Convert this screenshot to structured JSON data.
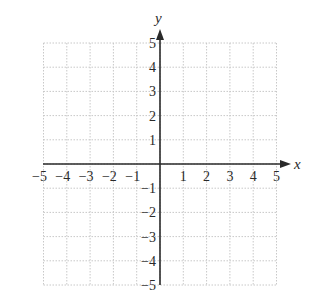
{
  "chart_data": {
    "type": "scatter",
    "title": "",
    "xlabel": "x",
    "ylabel": "y",
    "xlim": [
      -5,
      5
    ],
    "ylim": [
      -5,
      5
    ],
    "grid": true,
    "grid_style": "dotted",
    "x_ticks": [
      -5,
      -4,
      -3,
      -2,
      -1,
      1,
      2,
      3,
      4,
      5
    ],
    "y_ticks": [
      5,
      4,
      3,
      2,
      1,
      -1,
      -2,
      -3,
      -4,
      -5
    ],
    "x_tick_labels": [
      "−5",
      "−4",
      "−3",
      "−2",
      "−1",
      "1",
      "2",
      "3",
      "4",
      "5"
    ],
    "y_tick_labels": [
      "5",
      "4",
      "3",
      "2",
      "1",
      "−1",
      "−2",
      "−3",
      "−4",
      "−5"
    ],
    "series": [],
    "legend": null
  },
  "colors": {
    "axis": "#2a2a2a",
    "grid": "#c8c8c8",
    "text": "#2a2a2a"
  }
}
